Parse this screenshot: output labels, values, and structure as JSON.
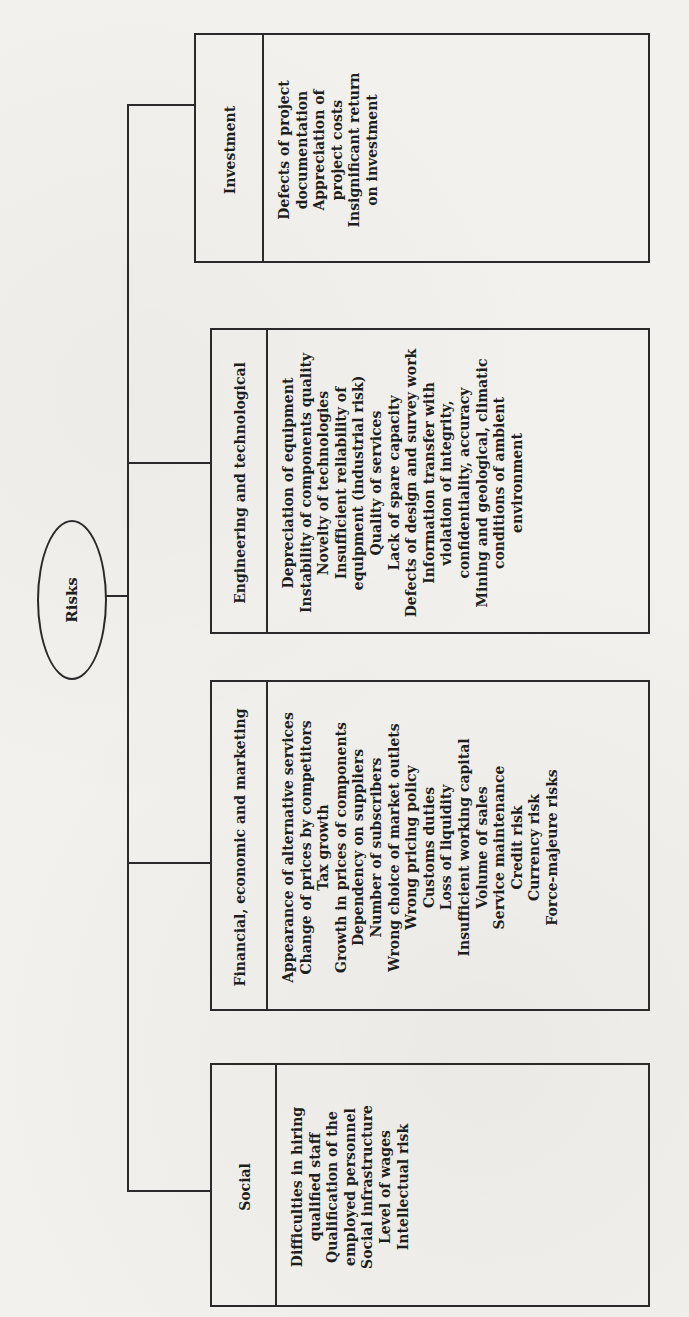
{
  "diagram": {
    "root": {
      "label": "Risks"
    },
    "categories": [
      {
        "id": "investment",
        "title": "Investment",
        "items": [
          "Defects of project documentation",
          "Appreciation of project costs",
          "Insignificant return on investment"
        ],
        "item_lines": [
          "Defects of project",
          "documentation",
          "Appreciation of",
          "project costs",
          "Insignificant return",
          "on investment"
        ]
      },
      {
        "id": "engineering",
        "title": "Engineering and technological",
        "items": [
          "Depreciation of equipment",
          "Instability of components quality",
          "Novelty of technologies",
          "Insufficient reliability of equipment (industrial risk)",
          "Quality of services",
          "Lack of spare capacity",
          "Defects of design and survey work",
          "Information transfer with violation of integrity, confidentiality, accuracy",
          "Mining and geological, climatic conditions of ambient environment"
        ],
        "item_lines": [
          "Depreciation of equipment",
          "Instability of components quality",
          "Novelty of technologies",
          "Insufficient reliability of",
          "equipment (industrial risk)",
          "Quality of services",
          "Lack of spare capacity",
          "Defects of design and survey work",
          "Information transfer with",
          "violation of integrity,",
          "confidentiality, accuracy",
          "Mining and geological, climatic",
          "conditions of ambient",
          "environment"
        ]
      },
      {
        "id": "financial",
        "title": "Financial, economic and marketing",
        "items": [
          "Appearance of alternative services",
          "Change of prices by competitors",
          "Tax growth",
          "Growth in prices of components",
          "Dependency on suppliers",
          "Number of subscribers",
          "Wrong choice of market outlets",
          "Wrong pricing policy",
          "Customs duties",
          "Loss of liquidity",
          "Insufficient working capital",
          "Volume of sales",
          "Service maintenance",
          "Credit risk",
          "Currency risk",
          "Force-majeure risks"
        ],
        "item_lines": [
          "Appearance of alternative services",
          "Change of prices by competitors",
          "Tax growth",
          "Growth in prices of components",
          "Dependency on suppliers",
          "Number of subscribers",
          "Wrong choice of market outlets",
          "Wrong pricing policy",
          "Customs duties",
          "Loss of liquidity",
          "Insufficient working capital",
          "Volume of sales",
          "Service maintenance",
          "Credit risk",
          "Currency risk",
          "Force-majeure risks"
        ]
      },
      {
        "id": "social",
        "title": "Social",
        "items": [
          "Difficulties in hiring qualified staff",
          "Qualification of the employed personnel",
          "Social infrastructure",
          "Level of wages",
          "Intellectual risk"
        ],
        "item_lines": [
          "Difficulties in hiring",
          "qualified staff",
          "Qualification of the",
          "employed personnel",
          "Social infrastructure",
          "Level of wages",
          "Intellectual risk"
        ]
      }
    ],
    "orientation": "rotated -90deg (landscape diagram on portrait page)"
  }
}
